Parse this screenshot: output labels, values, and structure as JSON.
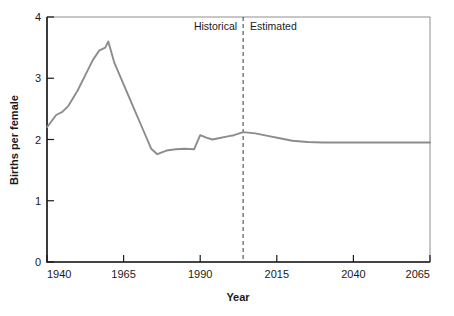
{
  "chart_data": {
    "type": "line",
    "title": "",
    "xlabel": "Year",
    "ylabel": "Births per female",
    "xlim": [
      1940,
      2065
    ],
    "ylim": [
      0,
      4
    ],
    "xticks": [
      1940,
      1965,
      1990,
      2015,
      2040,
      2065
    ],
    "xtick_labels": [
      "1940",
      "1965",
      "1990",
      "2015",
      "2040",
      "2065"
    ],
    "yticks": [
      0,
      1,
      2,
      3,
      4
    ],
    "ytick_labels": [
      "0",
      "1",
      "2",
      "3",
      "4"
    ],
    "grid": false,
    "legend": "none",
    "line_color": "#8c8c8c",
    "annotations": [
      {
        "name": "historical-label",
        "text": "Historical",
        "x": 1995,
        "align": "right"
      },
      {
        "name": "estimated-label",
        "text": "Estimated",
        "x": 2012,
        "align": "left"
      },
      {
        "name": "divider",
        "text": "",
        "x": 2004,
        "style": "dashed-vertical"
      }
    ],
    "series": [
      {
        "name": "Total fertility rate",
        "x": [
          1940,
          1943,
          1945,
          1947,
          1950,
          1953,
          1955,
          1957,
          1959,
          1960,
          1962,
          1965,
          1968,
          1971,
          1974,
          1976,
          1979,
          1982,
          1985,
          1988,
          1990,
          1992,
          1994,
          1996,
          1999,
          2001,
          2004,
          2008,
          2012,
          2016,
          2020,
          2025,
          2030,
          2040,
          2050,
          2060,
          2065
        ],
        "values": [
          2.2,
          2.4,
          2.45,
          2.55,
          2.8,
          3.1,
          3.3,
          3.45,
          3.5,
          3.6,
          3.25,
          2.9,
          2.55,
          2.2,
          1.85,
          1.76,
          1.82,
          1.84,
          1.85,
          1.84,
          2.07,
          2.03,
          2.0,
          2.02,
          2.05,
          2.07,
          2.12,
          2.1,
          2.06,
          2.02,
          1.98,
          1.96,
          1.95,
          1.95,
          1.95,
          1.95,
          1.95
        ]
      }
    ]
  }
}
